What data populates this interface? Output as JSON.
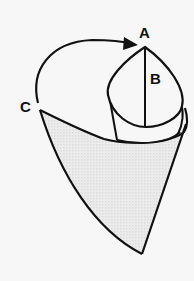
{
  "diagram": {
    "type": "cone-paper-fold-illustration",
    "labels": {
      "a": "A",
      "b": "B",
      "c": "C"
    },
    "arrow": {
      "from": "C",
      "to": "A",
      "icon": "curved-arrow-icon"
    },
    "colors": {
      "background": "#f7f7f7",
      "stroke": "#111111",
      "shading": "#e4e4e4",
      "inner_fill": "#f7f7f7"
    }
  }
}
